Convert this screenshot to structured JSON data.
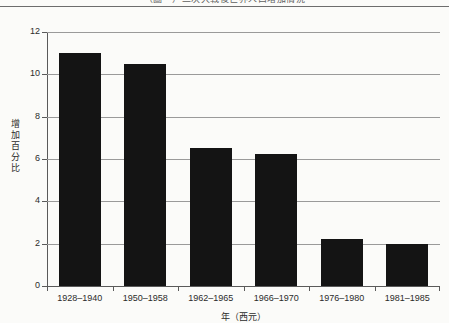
{
  "title_strip": {
    "title_text": "（圖一）二次大戰後世界人口增加情況"
  },
  "chart_data": {
    "type": "bar",
    "title": "（圖一）二次大戰後世界人口增加情況",
    "xlabel": "年（西元）",
    "ylabel": "增加百分比",
    "categories": [
      "1928–1940",
      "1950–1958",
      "1962–1965",
      "1966–1970",
      "1976–1980",
      "1981–1985"
    ],
    "values": [
      11.0,
      10.5,
      6.5,
      6.25,
      2.2,
      2.0
    ],
    "ylim": [
      0,
      12
    ],
    "yticks": [
      0,
      2,
      4,
      6,
      8,
      10,
      12
    ],
    "ytick_labels": [
      "0",
      "2",
      "4",
      "6",
      "8",
      "10",
      "12"
    ],
    "grid": true,
    "legend": "none",
    "bar_color": "#141414",
    "grid_color": "#9a9a9a",
    "axis_color": "#5a5a5a",
    "background_color": "#fbfbf9"
  }
}
